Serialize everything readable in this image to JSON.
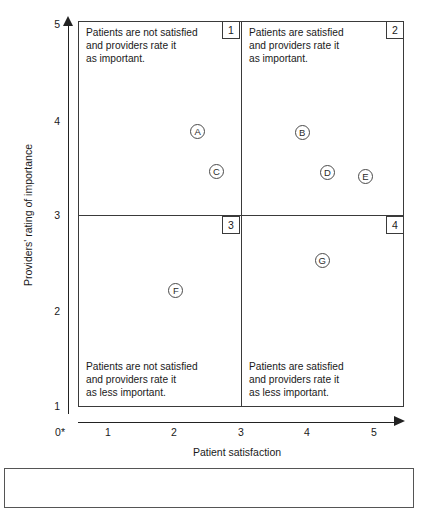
{
  "chart_data": {
    "type": "scatter",
    "title": "",
    "xlabel": "Patient satisfaction",
    "ylabel": "Providers' rating of importance",
    "xlim": [
      0.5,
      5.5
    ],
    "ylim": [
      0.75,
      5.0
    ],
    "xticks": [
      "1",
      "2",
      "3",
      "4",
      "5"
    ],
    "yticks": [
      "5",
      "4",
      "3",
      "2",
      "1"
    ],
    "origin_label": "0*",
    "grid": false,
    "legend": null,
    "quadrant_dividers": {
      "x": 3,
      "y": 3
    },
    "points": [
      {
        "label": "A",
        "x": 2.35,
        "y": 3.87
      },
      {
        "label": "B",
        "x": 3.92,
        "y": 3.86
      },
      {
        "label": "C",
        "x": 2.63,
        "y": 3.45
      },
      {
        "label": "D",
        "x": 4.3,
        "y": 3.44
      },
      {
        "label": "E",
        "x": 4.87,
        "y": 3.4
      },
      {
        "label": "F",
        "x": 2.02,
        "y": 2.2
      },
      {
        "label": "G",
        "x": 4.22,
        "y": 2.51
      }
    ],
    "quadrants": [
      {
        "number": "1",
        "text": "Patients are not satisfied\nand providers rate it\nas important."
      },
      {
        "number": "2",
        "text": "Patients are satisfied\nand providers rate it\nas important."
      },
      {
        "number": "3",
        "text": "Patients are not satisfied\nand providers rate it\nas less important."
      },
      {
        "number": "4",
        "text": "Patients are satisfied\nand providers rate it\nas less important."
      }
    ]
  },
  "caption": {
    "text": ""
  }
}
